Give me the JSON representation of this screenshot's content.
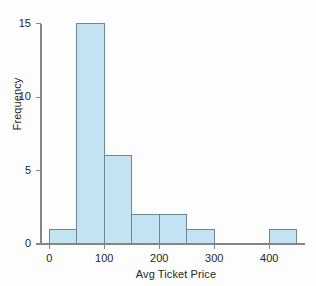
{
  "chart_data": {
    "type": "bar",
    "title": "",
    "subtitle": "",
    "xlabel": "Avg Ticket Price",
    "ylabel": "Frequency",
    "bin_width": 50,
    "categories": [
      "0-50",
      "50-100",
      "100-150",
      "150-200",
      "200-250",
      "250-300",
      "300-350",
      "350-400",
      "400-450"
    ],
    "bin_edges": [
      0,
      50,
      100,
      150,
      200,
      250,
      300,
      350,
      400,
      450
    ],
    "values": [
      1,
      15,
      6,
      2,
      2,
      1,
      0,
      0,
      1
    ],
    "xlim": [
      -15,
      465
    ],
    "ylim": [
      0,
      15.8
    ],
    "xticks": [
      0,
      100,
      200,
      300,
      400
    ],
    "xtick_labels": [
      "0",
      "100",
      "200",
      "300",
      "400"
    ],
    "yticks": [
      0,
      5,
      10,
      15
    ],
    "ytick_labels": [
      "0",
      "5",
      "10",
      "15"
    ],
    "grid": false,
    "legend": false,
    "legend_position": "none",
    "bar_fill_color": "#c3e2f2",
    "bar_border_color": "#6e8796",
    "axis_color": "#858585",
    "text_color": "#262626",
    "background_color": "#fdfdfd"
  }
}
